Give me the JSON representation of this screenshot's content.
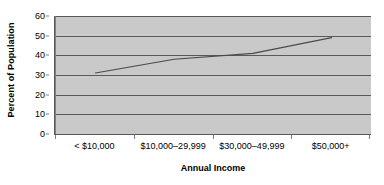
{
  "chart_data": {
    "type": "line",
    "title": "",
    "xlabel": "Annual Income",
    "ylabel": "Percent of Population",
    "categories": [
      "< $10,000",
      "$10,000–29,999",
      "$30,000–49,999",
      "$50,000+"
    ],
    "series": [
      {
        "name": "Percent of Population",
        "values": [
          31,
          38,
          41,
          49
        ]
      }
    ],
    "ylim": [
      0,
      60
    ],
    "yticks": [
      0,
      10,
      20,
      30,
      40,
      50,
      60
    ],
    "ytick_labels": [
      "0",
      "10",
      "20",
      "30",
      "40",
      "50",
      "60"
    ],
    "grid": true,
    "grid_axis": "y",
    "legend": false,
    "legend_position": "none",
    "colors": {
      "plot_background": "#c9c9c9",
      "figure_background": "#ffffff",
      "gridline": "#5a5a5a",
      "axis": "#5a5a5a",
      "series_line": "#4a4a4a",
      "text": "#000000"
    }
  }
}
